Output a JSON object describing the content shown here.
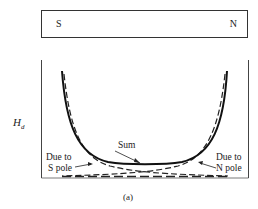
{
  "magnet": {
    "left_pole": "S",
    "right_pole": "N"
  },
  "plot": {
    "y_axis_label": "H",
    "y_axis_subscript": "d",
    "curves": [
      {
        "name": "Sum",
        "style": "solid"
      },
      {
        "name": "Due to S pole",
        "style": "dashed"
      },
      {
        "name": "Due to N pole",
        "style": "dashed"
      }
    ],
    "labels": {
      "sum": "Sum",
      "s_pole_line1": "Due to",
      "s_pole_line2": "S pole",
      "n_pole_line1": "Due to",
      "n_pole_line2": "N pole"
    }
  },
  "caption": "(a)"
}
